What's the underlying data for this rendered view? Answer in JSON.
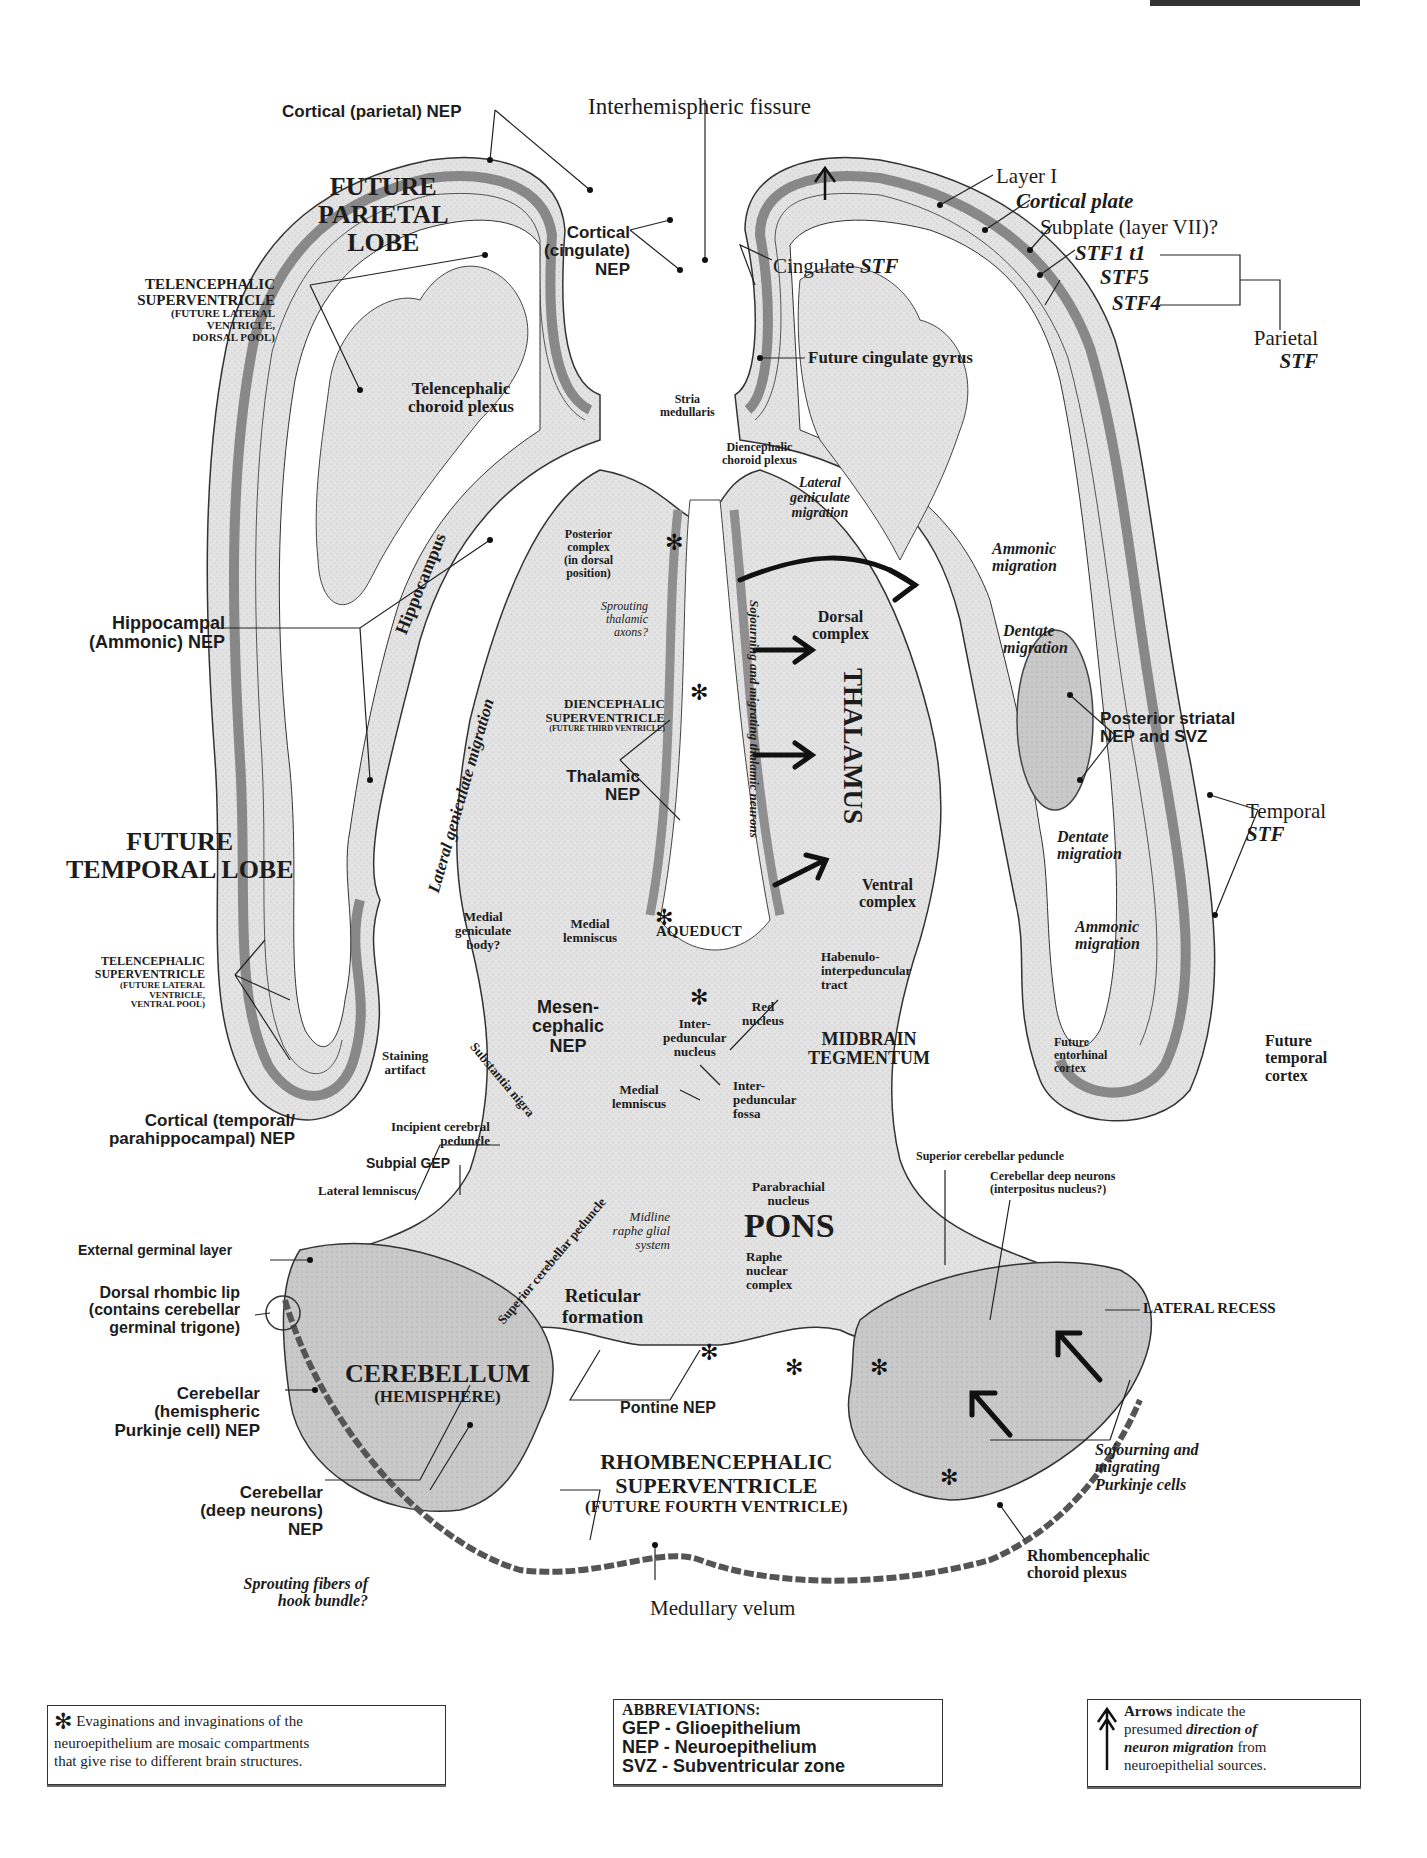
{
  "header": {
    "plate_label": "PLATE 11B (cropped)"
  },
  "labels": {
    "cortical_parietal_nep": "Cortical (parietal) NEP",
    "interhemispheric_fissure": "Interhemispheric fissure",
    "future_parietal_lobe": [
      "FUTURE",
      "PARIETAL",
      "LOBE"
    ],
    "cortical_cingulate_nep": [
      "Cortical",
      "(cingulate)",
      "NEP"
    ],
    "telencephalic_superventricle_dorsal": [
      "TELENCEPHALIC",
      "SUPERVENTRICLE",
      "(FUTURE LATERAL",
      "VENTRICLE,",
      "DORSAL POOL)"
    ],
    "telencephalic_choroid_plexus": [
      "Telencephalic",
      "choroid plexus"
    ],
    "stria_medullaris": [
      "Stria",
      "medullaris"
    ],
    "diencephalic_choroid_plexus": [
      "Diencephalic",
      "choroid plexus"
    ],
    "cingulate_stf": {
      "prefix": "Cingulate ",
      "em": "STF"
    },
    "future_cingulate_gyrus": "Future cingulate gyrus",
    "layer_i": "Layer I",
    "cortical_plate": "Cortical plate",
    "subplate": "Subplate (layer VII)?",
    "stf1": "STF1 t1",
    "stf5": "STF5",
    "stf4": "STF4",
    "parietal_stf": [
      "Parietal",
      "STF"
    ],
    "lateral_geniculate_migration": [
      "Lateral",
      "geniculate",
      "migration"
    ],
    "posterior_complex": [
      "Posterior",
      "complex",
      "(in dorsal",
      "position)"
    ],
    "sprouting_thalamic_axons": [
      "Sprouting",
      "thalamic",
      "axons?"
    ],
    "ammonic_migration_upper": [
      "Ammonic",
      "migration"
    ],
    "dentate_migration_upper": [
      "Dentate",
      "migration"
    ],
    "dorsal_complex": [
      "Dorsal",
      "complex"
    ],
    "thalamus": "THALAMUS",
    "sojourning_thalamic": "Sojourning and migrating thalamic neurons",
    "diencephalic_superventricle": [
      "DIENCEPHALIC",
      "SUPERVENTRICLE",
      "(FUTURE THIRD VENTRICLE)"
    ],
    "hippocampal_nep": [
      "Hippocampal",
      "(Ammonic) NEP"
    ],
    "hippocampus": "Hippocampus",
    "lateral_geniculate_migration_vertical": "Lateral geniculate migration",
    "posterior_striatal": [
      "Posterior striatal",
      "NEP and SVZ"
    ],
    "thalamic_nep": [
      "Thalamic",
      "NEP"
    ],
    "temporal_stf": [
      "Temporal",
      "STF"
    ],
    "dentate_migration_lower": [
      "Dentate",
      "migration"
    ],
    "future_temporal_lobe": [
      "FUTURE",
      "TEMPORAL LOBE"
    ],
    "ventral_complex": [
      "Ventral",
      "complex"
    ],
    "medial_geniculate_body": [
      "Medial",
      "geniculate",
      "body?"
    ],
    "medial_lemniscus_upper": [
      "Medial",
      "lemniscus"
    ],
    "aqueduct": "AQUEDUCT",
    "ammonic_migration_lower": [
      "Ammonic",
      "migration"
    ],
    "habenulo_tract": [
      "Habenulo-",
      "interpeduncular",
      "tract"
    ],
    "telencephalic_superventricle_ventral": [
      "TELENCEPHALIC",
      "SUPERVENTRICLE",
      "(FUTURE LATERAL",
      "VENTRICLE,",
      "VENTRAL POOL)"
    ],
    "mesencephalic_nep": [
      "Mesen-",
      "cephalic",
      "NEP"
    ],
    "red_nucleus": [
      "Red",
      "nucleus"
    ],
    "interpeduncular_nucleus": [
      "Inter-",
      "peduncular",
      "nucleus"
    ],
    "midbrain_tegmentum": [
      "MIDBRAIN",
      "TEGMENTUM"
    ],
    "future_entorhinal_cortex": [
      "Future",
      "entorhinal",
      "cortex"
    ],
    "future_temporal_cortex": [
      "Future",
      "temporal",
      "cortex"
    ],
    "staining_artifact": [
      "Staining",
      "artifact"
    ],
    "substantia_nigra": "Substantia nigra",
    "cortical_temporal_nep": [
      "Cortical (temporal/",
      "parahippocampal) NEP"
    ],
    "incipient_cerebral_peduncle": [
      "Incipient cerebral",
      "peduncle"
    ],
    "medial_lemniscus_lower": [
      "Medial",
      "lemniscus"
    ],
    "interpeduncular_fossa": [
      "Inter-",
      "peduncular",
      "fossa"
    ],
    "subpial_gep": "Subpial GEP",
    "superior_cerebellar_peduncle_right": "Superior cerebellar peduncle",
    "lateral_lemniscus": "Lateral lemniscus",
    "cerebellar_deep_neurons": [
      "Cerebellar deep neurons",
      "(interpositus nucleus?)"
    ],
    "parabrachial_nucleus": [
      "Parabrachial",
      "nucleus"
    ],
    "midline_raphe": [
      "Midline",
      "raphe glial",
      "system"
    ],
    "pons": "PONS",
    "external_germinal_layer": "External germinal layer",
    "superior_cerebellar_peduncle_left": "Superior cerebellar peduncle",
    "raphe_nuclear_complex": [
      "Raphe",
      "nuclear",
      "complex"
    ],
    "lateral_recess": "LATERAL RECESS",
    "dorsal_rhombic_lip": [
      "Dorsal rhombic lip",
      "(contains cerebellar",
      "germinal trigone)"
    ],
    "reticular_formation": [
      "Reticular",
      "formation"
    ],
    "cerebellum": [
      "CEREBELLUM",
      "(HEMISPHERE)"
    ],
    "cerebellar_purkinje_nep": [
      "Cerebellar",
      "(hemispheric",
      "Purkinje cell) NEP"
    ],
    "pontine_nep": "Pontine NEP",
    "sojourning_purkinje": [
      "Sojourning and",
      "migrating",
      "Purkinje cells"
    ],
    "cerebellar_deep_nep": [
      "Cerebellar",
      "(deep neurons)",
      "NEP"
    ],
    "rhombencephalic_superventricle": [
      "RHOMBENCEPHALIC",
      "SUPERVENTRICLE",
      "(FUTURE FOURTH VENTRICLE)"
    ],
    "rhombencephalic_choroid_plexus": [
      "Rhombencephalic",
      "choroid plexus"
    ],
    "sprouting_hook_bundle": [
      "Sprouting fibers of",
      "hook bundle?"
    ],
    "medullary_velum": "Medullary velum"
  },
  "legend": {
    "asterisk": {
      "icon": "asterisk-compartment-icon",
      "text": [
        "Evaginations and invaginations of the",
        "neuroepithelium are mosaic compartments",
        "that give rise to different brain structures."
      ]
    },
    "abbreviations": {
      "title": "ABBREVIATIONS:",
      "items": [
        "GEP - Glioepithelium",
        "NEP - Neuroepithelium",
        "SVZ - Subventricular zone"
      ]
    },
    "arrows": {
      "icon": "migration-arrow-icon",
      "bold_lead": "Arrows",
      "text_1": " indicate the",
      "text_2": "presumed ",
      "em_1": "direction of",
      "em_2": "neuron migration",
      "text_3": " from",
      "text_4": "neuroepithelial sources."
    }
  },
  "colors": {
    "tissue": "#d9d9d9",
    "neuroepithelium": "#9a9a9a",
    "ventricle": "#ffffff",
    "ink": "#1c1c1c"
  }
}
